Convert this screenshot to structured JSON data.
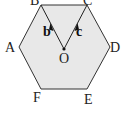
{
  "diagram": {
    "shape": "regular-hexagon",
    "fill": "#e8e8e8",
    "stroke": "#333333",
    "vertices": [
      {
        "id": "A",
        "x": 19,
        "y": 47,
        "label": "A",
        "lx": 5,
        "ly": 52
      },
      {
        "id": "B",
        "x": 41,
        "y": 5,
        "label": "B",
        "lx": 30,
        "ly": 5
      },
      {
        "id": "C",
        "x": 87,
        "y": 5,
        "label": "C",
        "lx": 83,
        "ly": 5
      },
      {
        "id": "D",
        "x": 110,
        "y": 47,
        "label": "D",
        "lx": 110,
        "ly": 52
      },
      {
        "id": "E",
        "x": 87,
        "y": 89,
        "label": "E",
        "lx": 84,
        "ly": 104
      },
      {
        "id": "F",
        "x": 41,
        "y": 89,
        "label": "F",
        "lx": 33,
        "ly": 102
      }
    ],
    "center": {
      "id": "O",
      "x": 64,
      "y": 49,
      "label": "O",
      "lx": 59,
      "ly": 63
    },
    "vectors": [
      {
        "name": "b",
        "from": "O",
        "to": "B",
        "label": "b",
        "lx": 43,
        "ly": 36
      },
      {
        "name": "c",
        "from": "O",
        "to": "C",
        "label": "c",
        "lx": 76,
        "ly": 36
      }
    ]
  }
}
